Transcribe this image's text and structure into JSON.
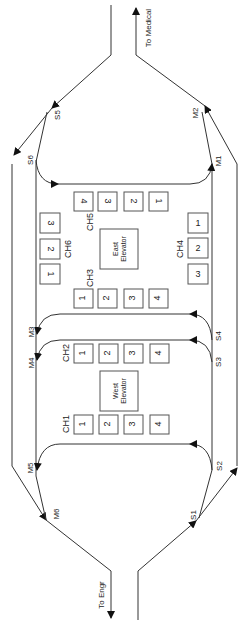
{
  "diagram": {
    "orientation": "rotated-90-ccw",
    "exits": {
      "top": "To Medical",
      "bottom": "To Engr"
    },
    "elevators": {
      "east": {
        "line1": "East",
        "line2": "Elevator"
      },
      "west": {
        "line1": "West",
        "line2": "Elevator"
      }
    },
    "chutes": {
      "CH1": {
        "label": "CH1",
        "slots": [
          "1",
          "2",
          "3",
          "4"
        ]
      },
      "CH2": {
        "label": "CH2",
        "slots": [
          "1",
          "2",
          "3",
          "4"
        ]
      },
      "CH3": {
        "label": "CH3",
        "slots": [
          "1",
          "2",
          "3",
          "4"
        ]
      },
      "CH4": {
        "label": "CH4",
        "slots": [
          "1",
          "2",
          "3"
        ]
      },
      "CH5": {
        "label": "CH5",
        "slots": [
          "4",
          "3",
          "2",
          "1"
        ]
      },
      "CH6": {
        "label": "CH6",
        "slots": [
          "3",
          "2",
          "1"
        ]
      }
    },
    "nodes": {
      "S1": "S1",
      "S2": "S2",
      "S3": "S3",
      "S4": "S4",
      "S5": "S5",
      "S6": "S6",
      "M1": "M1",
      "M2": "M2",
      "M3": "M3",
      "M4": "M4",
      "M5": "M5",
      "M6": "M6"
    },
    "colors": {
      "line": "#333333",
      "box_border": "#555555",
      "background": "#ffffff"
    }
  }
}
